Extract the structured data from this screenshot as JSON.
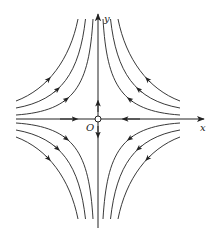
{
  "diagram": {
    "type": "phase-portrait-saddle",
    "labels": {
      "x_axis": "x",
      "y_axis": "y",
      "origin": "O"
    },
    "origin_px": [
      98,
      119
    ],
    "x_axis": {
      "from": [
        16,
        119
      ],
      "to": [
        204,
        119
      ],
      "arrows_toward_origin": true
    },
    "y_axis": {
      "from": [
        98,
        228
      ],
      "to": [
        98,
        13
      ],
      "arrows_away_from_origin": true
    },
    "trajectory_offsets": [
      6,
      14,
      22
    ],
    "quadrants": [
      "upper-left",
      "upper-right",
      "lower-left",
      "lower-right"
    ],
    "stroke_color": "#222222"
  }
}
